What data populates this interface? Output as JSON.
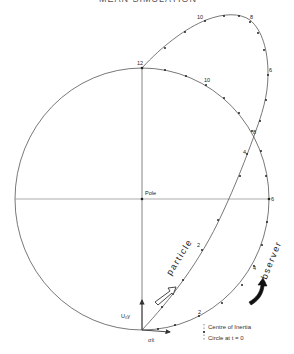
{
  "header": {
    "title": "MEAN SIMULATION"
  },
  "diagram": {
    "pole_label": "Pole",
    "velocity_label": "U₀y",
    "sigma_label": "σx̄",
    "particle_label": "particle",
    "observer_label": "observer",
    "circle_time_labels": {
      "t12": "12",
      "t10": "10",
      "t8": "8",
      "t6": "6",
      "t4": "4",
      "t2": "2"
    },
    "particle_time_labels": {
      "t2": "2",
      "t4": "4",
      "t6": "6",
      "t8": "8",
      "t10": "10"
    },
    "legend": {
      "centre_of_inertia": "Centre of Inertia",
      "circle_at_t0": "Circle at t = 0"
    },
    "colors": {
      "line": "#444444",
      "axis": "#777777",
      "text": "#222222",
      "background": "#ffffff"
    }
  }
}
